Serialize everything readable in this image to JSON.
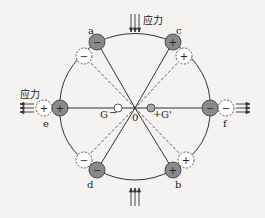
{
  "figure": {
    "stress_label_top": "应力",
    "stress_label_left": "应力",
    "origin_label": "0",
    "g_left_label": "G",
    "g_left_sign": "−",
    "g_right_label": "G'",
    "g_right_sign": "+",
    "points": {
      "a": {
        "label": "a",
        "sign": "−"
      },
      "b": {
        "label": "b",
        "sign": "+"
      },
      "c": {
        "label": "c",
        "sign": "+"
      },
      "d": {
        "label": "d",
        "sign": "−"
      },
      "e": {
        "label": "e",
        "sign": "+"
      },
      "f": {
        "label": "f",
        "sign": "−"
      }
    },
    "displaced_points": {
      "a": {
        "sign": "−"
      },
      "b": {
        "sign": "+"
      },
      "c": {
        "sign": "+"
      },
      "d": {
        "sign": "−"
      },
      "e": {
        "sign": "+"
      },
      "f": {
        "sign": "−"
      }
    },
    "colors": {
      "filled_particle": "#8a8a8a",
      "line": "#333333",
      "background": "#f4f3f1"
    }
  }
}
